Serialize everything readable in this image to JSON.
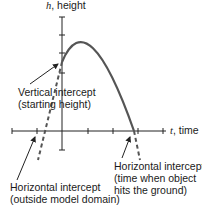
{
  "diagram": {
    "vertical_axis": {
      "variable": "h",
      "label": ", height"
    },
    "horizontal_axis": {
      "variable": "t",
      "label": ", time"
    },
    "annotations": {
      "vertical_intercept": {
        "line1": "Vertical intercept",
        "line2": "(starting height)"
      },
      "horizontal_intercept_right": {
        "line1": "Horizontal intercept",
        "line2": "(time when object",
        "line3": "hits the ground)"
      },
      "horizontal_intercept_left": {
        "line1": "Horizontal intercept",
        "line2": "(outside model domain)"
      }
    },
    "colors": {
      "curve": "#555555",
      "axis": "#222222",
      "text": "#1a1a1a"
    }
  }
}
